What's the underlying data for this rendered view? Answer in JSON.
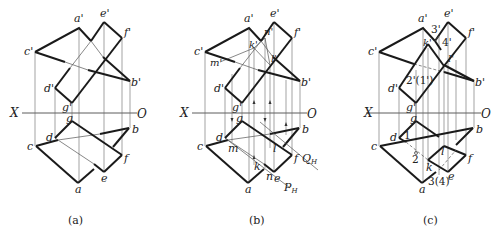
{
  "figure": {
    "panels": [
      {
        "caption": "(a)",
        "axis": {
          "x_label": "X",
          "o_label": "O"
        },
        "labels": {
          "a_p": "a'",
          "e_p": "e'",
          "f_p": "f'",
          "c_p": "c'",
          "b_p": "b'",
          "d_p": "d'",
          "g_p": "g'",
          "g": "g",
          "d": "d",
          "c": "c",
          "b": "b",
          "f": "f",
          "e": "e",
          "a": "a"
        }
      },
      {
        "caption": "(b)",
        "axis": {
          "x_label": "X",
          "o_label": "O"
        },
        "labels": {
          "a_p": "a'",
          "e_p": "e'",
          "f_p": "f'",
          "c_p": "c'",
          "b_p": "b'",
          "d_p": "d'",
          "g_p": "g'",
          "k_p": "k'",
          "n_p": "n'",
          "m_p": "m'",
          "l_p": "l'",
          "g": "g",
          "d": "d",
          "c": "c",
          "b": "b",
          "f": "f",
          "e": "e",
          "a": "a",
          "m": "m",
          "k": "k",
          "n": "n",
          "l": "l",
          "Q": "Q",
          "Q_sub": "H",
          "P": "P",
          "P_sub": "H"
        }
      },
      {
        "caption": "(c)",
        "axis": {
          "x_label": "X",
          "o_label": "O"
        },
        "labels": {
          "a_p": "a'",
          "e_p": "e'",
          "f_p": "f'",
          "c_p": "c'",
          "b_p": "b'",
          "d_p": "d'",
          "g_p": "g'",
          "k_p": "k'",
          "l_p": "l'",
          "p3_p": "3'",
          "p4_p": "4'",
          "p21_p": "2'(1')",
          "g": "g",
          "d": "d",
          "c": "c",
          "b": "b",
          "f": "f",
          "e": "e",
          "a": "a",
          "k": "k",
          "l": "l",
          "p1": "1",
          "p2": "2",
          "p34": "3(4)"
        }
      }
    ]
  }
}
